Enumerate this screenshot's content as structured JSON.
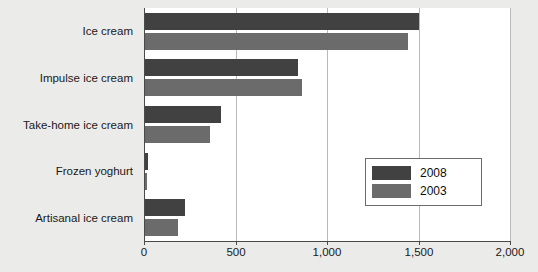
{
  "chart_data": {
    "type": "bar",
    "orientation": "horizontal",
    "title": "",
    "xlabel": "",
    "ylabel": "",
    "xlim": [
      0,
      2000
    ],
    "grid": true,
    "legend_position": "middle-right",
    "categories": [
      "Ice cream",
      "Impulse ice cream",
      "Take-home ice cream",
      "Frozen yoghurt",
      "Artisanal ice cream"
    ],
    "xticks": [
      0,
      500,
      1000,
      1500,
      2000
    ],
    "xtick_labels": [
      "0",
      "500",
      "1,000",
      "1,500",
      "2,000"
    ],
    "series": [
      {
        "name": "2008",
        "color": "#414141",
        "values": [
          1500,
          840,
          420,
          20,
          225
        ]
      },
      {
        "name": "2003",
        "color": "#6b6b6b",
        "values": [
          1440,
          865,
          360,
          15,
          185
        ]
      }
    ]
  },
  "legend": {
    "entries": [
      {
        "label": "2008",
        "color": "#414141"
      },
      {
        "label": "2003",
        "color": "#6b6b6b"
      }
    ]
  },
  "colors": {
    "background": "#ebebe9",
    "plot_background": "#ffffff",
    "axis": "#4a4a4a",
    "gridline": "#b9b9b9",
    "series_2008": "#414141",
    "series_2003": "#6b6b6b"
  }
}
